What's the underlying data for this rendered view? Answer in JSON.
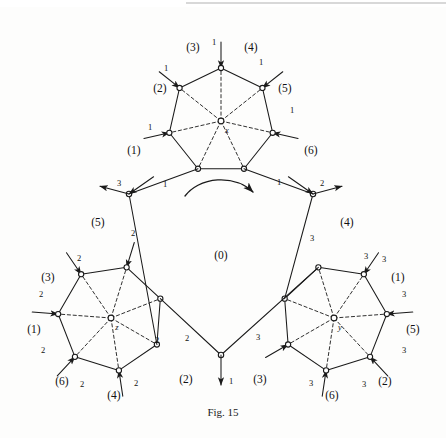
{
  "figure": {
    "caption": "Fig. 15",
    "type": "graph-diagram"
  },
  "centers": [
    {
      "name": "x",
      "label": "x",
      "cx": 221,
      "cy": 121,
      "rot": 0
    },
    {
      "name": "z",
      "label": "z",
      "cx": 111,
      "cy": 318,
      "rot": 120
    },
    {
      "name": "y",
      "label": "y",
      "cx": 334,
      "cy": 318,
      "rot": 240
    }
  ],
  "region_labels": [
    {
      "text": "(0)",
      "x": 221,
      "y": 255
    },
    {
      "text": "(3)",
      "x": 193,
      "y": 47
    },
    {
      "text": "(4)",
      "x": 251,
      "y": 47
    },
    {
      "text": "(2)",
      "x": 160,
      "y": 88
    },
    {
      "text": "(5)",
      "x": 285,
      "y": 88
    },
    {
      "text": "(1)",
      "x": 134,
      "y": 150
    },
    {
      "text": "(6)",
      "x": 311,
      "y": 150
    },
    {
      "text": "(5)",
      "x": 98,
      "y": 222
    },
    {
      "text": "(3)",
      "x": 48,
      "y": 277
    },
    {
      "text": "(1)",
      "x": 34,
      "y": 329
    },
    {
      "text": "(6)",
      "x": 62,
      "y": 381
    },
    {
      "text": "(4)",
      "x": 114,
      "y": 395
    },
    {
      "text": "(2)",
      "x": 186,
      "y": 379
    },
    {
      "text": "(4)",
      "x": 347,
      "y": 222
    },
    {
      "text": "(1)",
      "x": 398,
      "y": 277
    },
    {
      "text": "(5)",
      "x": 413,
      "y": 329
    },
    {
      "text": "(2)",
      "x": 385,
      "y": 381
    },
    {
      "text": "(6)",
      "x": 332,
      "y": 395
    },
    {
      "text": "(3)",
      "x": 260,
      "y": 379
    }
  ],
  "edge_labels": [
    {
      "text": "1",
      "x": 214,
      "y": 42
    },
    {
      "text": "1",
      "x": 166,
      "y": 68
    },
    {
      "text": "1",
      "x": 261,
      "y": 62
    },
    {
      "text": "1",
      "x": 150,
      "y": 127
    },
    {
      "text": "1",
      "x": 292,
      "y": 110
    },
    {
      "text": "1",
      "x": 165,
      "y": 184
    },
    {
      "text": "1",
      "x": 279,
      "y": 182
    },
    {
      "text": "3",
      "x": 119,
      "y": 183
    },
    {
      "text": "2",
      "x": 133,
      "y": 233
    },
    {
      "text": "2",
      "x": 322,
      "y": 183
    },
    {
      "text": "3",
      "x": 312,
      "y": 238
    },
    {
      "text": "2",
      "x": 79,
      "y": 258
    },
    {
      "text": "2",
      "x": 41,
      "y": 294
    },
    {
      "text": "2",
      "x": 43,
      "y": 350
    },
    {
      "text": "2",
      "x": 82,
      "y": 384
    },
    {
      "text": "2",
      "x": 136,
      "y": 383
    },
    {
      "text": "2",
      "x": 157,
      "y": 340
    },
    {
      "text": "2",
      "x": 187,
      "y": 338
    },
    {
      "text": "1",
      "x": 231,
      "y": 381
    },
    {
      "text": "3",
      "x": 258,
      "y": 337
    },
    {
      "text": "3",
      "x": 366,
      "y": 256
    },
    {
      "text": "3",
      "x": 404,
      "y": 294
    },
    {
      "text": "3",
      "x": 404,
      "y": 350
    },
    {
      "text": "3",
      "x": 364,
      "y": 384
    },
    {
      "text": "3",
      "x": 311,
      "y": 383
    },
    {
      "text": "3",
      "x": 384,
      "y": 259
    }
  ],
  "colors": {
    "stroke": "#1a1a1a",
    "background": "#fdfdfc",
    "text": "#111111"
  }
}
